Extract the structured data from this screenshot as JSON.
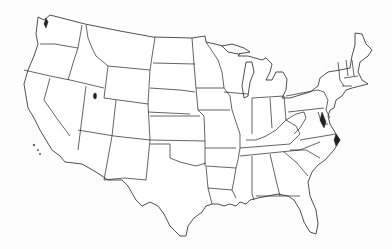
{
  "map": {
    "title": "",
    "kind": "United States outline map",
    "region": "Contiguous United States",
    "labels_visible": false,
    "colors": {
      "fill": "#ffffff",
      "stroke": "#222222",
      "background": "#fdfdfd"
    },
    "states": [
      "Washington",
      "Oregon",
      "California",
      "Idaho",
      "Nevada",
      "Montana",
      "Wyoming",
      "Utah",
      "Arizona",
      "Colorado",
      "New Mexico",
      "North Dakota",
      "South Dakota",
      "Nebraska",
      "Kansas",
      "Oklahoma",
      "Texas",
      "Minnesota",
      "Iowa",
      "Missouri",
      "Arkansas",
      "Louisiana",
      "Wisconsin",
      "Illinois",
      "Michigan",
      "Indiana",
      "Ohio",
      "Kentucky",
      "Tennessee",
      "Mississippi",
      "Alabama",
      "Georgia",
      "Florida",
      "South Carolina",
      "North Carolina",
      "Virginia",
      "West Virginia",
      "Maryland",
      "Delaware",
      "Pennsylvania",
      "New Jersey",
      "New York",
      "Connecticut",
      "Rhode Island",
      "Massachusetts",
      "Vermont",
      "New Hampshire",
      "Maine"
    ]
  }
}
